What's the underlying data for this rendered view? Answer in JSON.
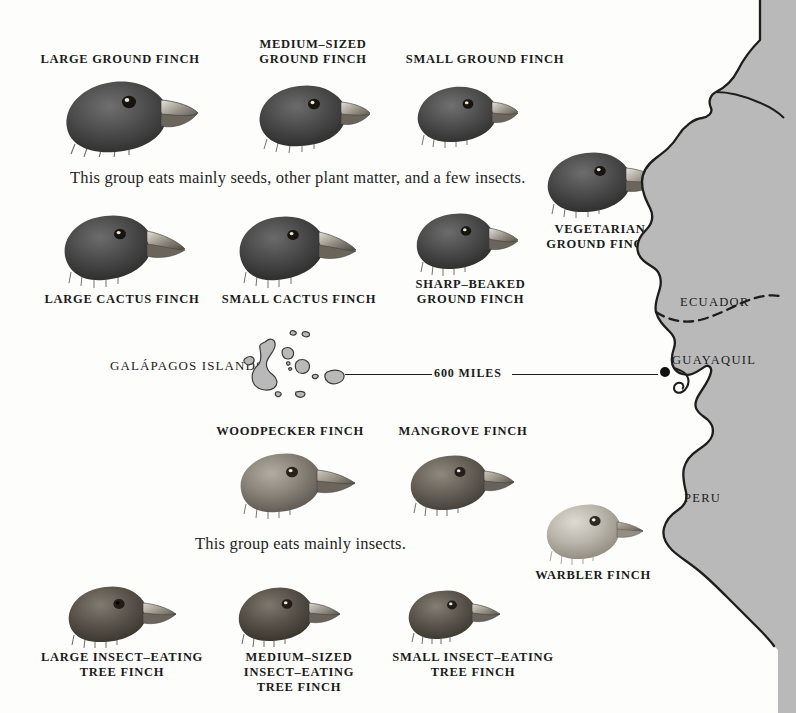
{
  "figure": {
    "background_color": "#fdfdfb",
    "ink_color": "#1b1b1b",
    "map_land_color": "#b9b9b9"
  },
  "groups": [
    {
      "id": "seed-eaters",
      "text": "This group eats mainly seeds, other plant matter, and a few insects."
    },
    {
      "id": "insect-eaters",
      "text": "This group eats mainly insects."
    }
  ],
  "captions": {
    "large_ground_finch": "LARGE GROUND FINCH",
    "medium_ground_finch": "MEDIUM–SIZED\nGROUND FINCH",
    "small_ground_finch": "SMALL GROUND FINCH",
    "vegetarian_ground_finch": "VEGETARIAN\nGROUND FINCH",
    "large_cactus_finch": "LARGE CACTUS FINCH",
    "small_cactus_finch": "SMALL CACTUS FINCH",
    "sharp_beaked_ground_finch": "SHARP–BEAKED\nGROUND FINCH",
    "woodpecker_finch": "WOODPECKER FINCH",
    "mangrove_finch": "MANGROVE FINCH",
    "warbler_finch": "WARBLER FINCH",
    "large_insect_tree_finch": "LARGE INSECT–EATING\nTREE FINCH",
    "medium_insect_tree_finch": "MEDIUM–SIZED\nINSECT–EATING\nTREE FINCH",
    "small_insect_tree_finch": "SMALL INSECT–EATING\nTREE FINCH"
  },
  "map": {
    "islands_label": "GALÁPAGOS ISLANDS",
    "distance_label": "600 MILES",
    "country_ecuador": "ECUADOR",
    "country_peru": "PERU",
    "city_guayaquil": "GUAYAQUIL"
  }
}
